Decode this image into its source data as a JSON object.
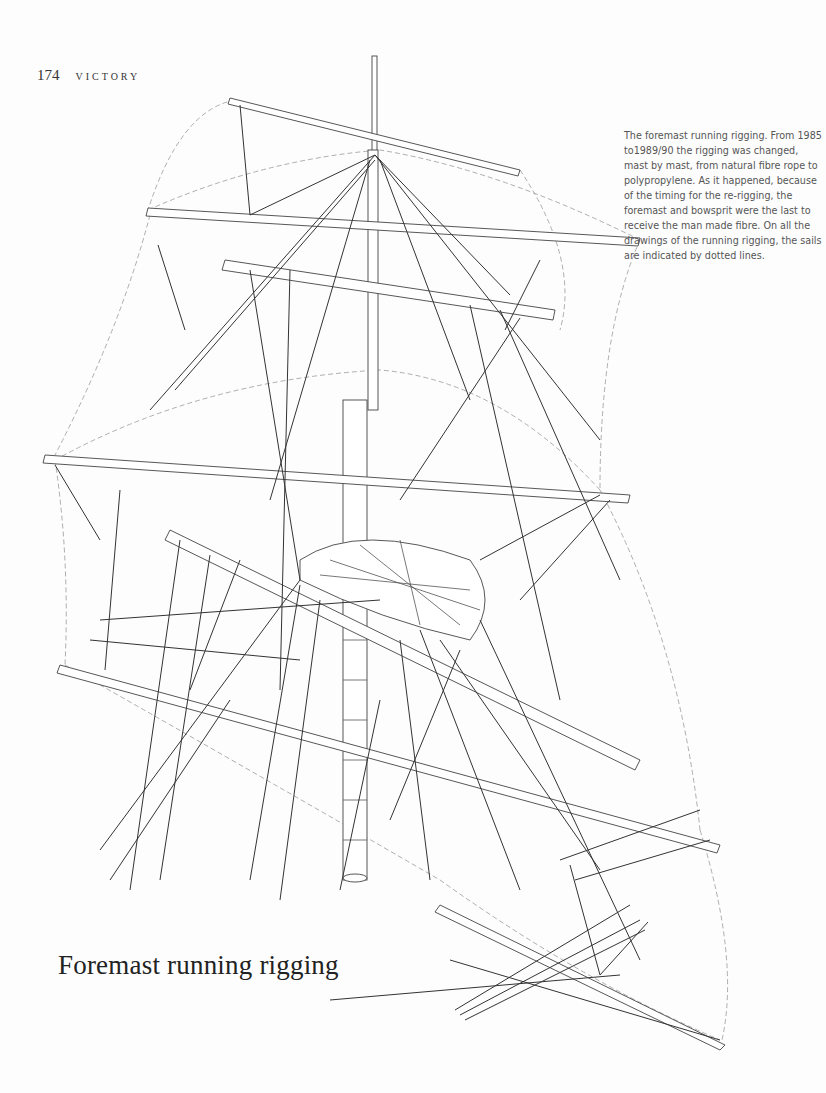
{
  "running_head": {
    "page_number": "174",
    "book_title": "VICTORY"
  },
  "caption": {
    "text": "The foremast running rigging. From 1985 to1989/90 the rigging was changed, mast by mast, from natural fibre rope to polypropylene. As it happened, because of the timing for the re-rigging, the foremast and bowsprit were the last to receive the man made fibre. On all the drawings of the running rigging, the sails are indicated by dotted lines."
  },
  "figure": {
    "title": "Foremast running rigging"
  }
}
